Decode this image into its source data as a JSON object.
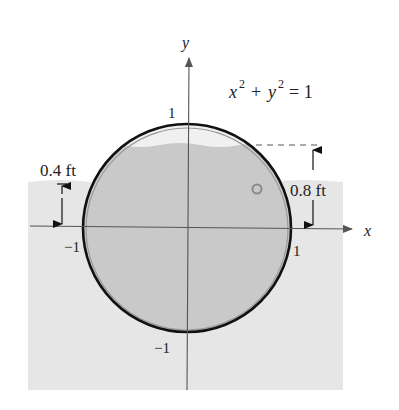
{
  "diagram": {
    "equation": {
      "x": "x",
      "y": "y",
      "exp": "2",
      "plus": "+",
      "equals": "= 1"
    },
    "axes": {
      "x_label": "x",
      "y_label": "y"
    },
    "ticks": {
      "y_top": "1",
      "y_bottom": "−1",
      "x_left": "−1",
      "x_right": "1"
    },
    "measurements": {
      "outside_depth": "0.4 ft",
      "inside_depth": "0.8 ft"
    },
    "colors": {
      "outer_water": "#e6e6e6",
      "inner_water": "#c9c9c9",
      "inner_air": "#eeeeee",
      "circle_stroke": "#111111",
      "axis": "#555555"
    }
  }
}
